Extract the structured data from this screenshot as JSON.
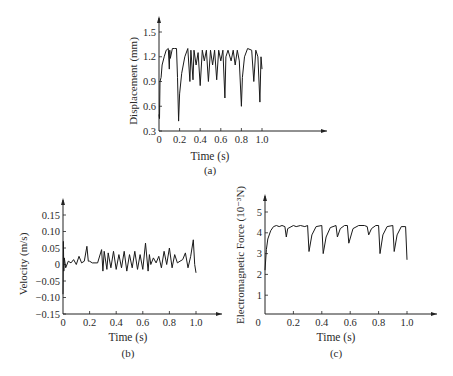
{
  "chart_data": [
    {
      "panel": "(a)",
      "type": "line",
      "xlabel": "Time (s)",
      "ylabel": "Displacement (mm)",
      "xticks": [
        "0",
        "0.2",
        "0.4",
        "0.6",
        "0.8",
        "1.0"
      ],
      "yticks": [
        "0.3",
        "0.6",
        "0.9",
        "1.2",
        "1.5"
      ],
      "xlim": [
        0,
        1.0
      ],
      "ylim": [
        0.3,
        1.65
      ],
      "grid": false,
      "x": [
        0,
        0.005,
        0.01,
        0.02,
        0.03,
        0.05,
        0.07,
        0.09,
        0.1,
        0.105,
        0.11,
        0.13,
        0.15,
        0.17,
        0.18,
        0.19,
        0.2,
        0.22,
        0.25,
        0.28,
        0.3,
        0.31,
        0.33,
        0.34,
        0.36,
        0.38,
        0.4,
        0.42,
        0.44,
        0.46,
        0.48,
        0.5,
        0.52,
        0.54,
        0.56,
        0.58,
        0.6,
        0.62,
        0.64,
        0.65,
        0.67,
        0.7,
        0.72,
        0.74,
        0.76,
        0.78,
        0.8,
        0.81,
        0.83,
        0.86,
        0.9,
        0.92,
        0.94,
        0.96,
        0.98,
        0.99,
        1.0
      ],
      "values": [
        0.5,
        0.45,
        0.9,
        0.95,
        1.1,
        1.2,
        1.28,
        1.3,
        1.05,
        1.28,
        1.18,
        1.3,
        1.3,
        1.3,
        0.95,
        0.42,
        0.75,
        1.0,
        1.2,
        1.3,
        0.9,
        1.28,
        0.92,
        1.28,
        1.1,
        1.25,
        0.85,
        1.28,
        1.15,
        1.28,
        0.9,
        1.28,
        1.1,
        1.28,
        0.92,
        1.28,
        1.15,
        1.28,
        0.7,
        1.2,
        1.28,
        1.15,
        1.28,
        1.1,
        1.28,
        1.15,
        0.6,
        0.95,
        1.2,
        1.3,
        1.28,
        0.9,
        1.28,
        1.2,
        0.65,
        1.2,
        1.05
      ],
      "caption": "(a)"
    },
    {
      "panel": "(b)",
      "type": "line",
      "xlabel": "Time (s)",
      "ylabel": "Velocity (m/s)",
      "xticks": [
        "0",
        "0.2",
        "0.4",
        "0.6",
        "0.8",
        "1.0"
      ],
      "yticks": [
        "-0.15",
        "-0.10",
        "-0.05",
        "0",
        "0.05",
        "0.10",
        "0.15"
      ],
      "xlim": [
        0,
        1.0
      ],
      "ylim": [
        -0.15,
        0.18
      ],
      "grid": false,
      "x": [
        0,
        0.003,
        0.006,
        0.01,
        0.02,
        0.04,
        0.06,
        0.08,
        0.1,
        0.12,
        0.14,
        0.16,
        0.18,
        0.19,
        0.2,
        0.22,
        0.26,
        0.29,
        0.3,
        0.31,
        0.33,
        0.34,
        0.36,
        0.38,
        0.4,
        0.42,
        0.44,
        0.46,
        0.48,
        0.5,
        0.52,
        0.54,
        0.56,
        0.58,
        0.6,
        0.62,
        0.64,
        0.65,
        0.66,
        0.68,
        0.7,
        0.72,
        0.74,
        0.76,
        0.78,
        0.8,
        0.82,
        0.84,
        0.86,
        0.88,
        0.9,
        0.92,
        0.94,
        0.96,
        0.98,
        0.99,
        1.0
      ],
      "values": [
        -0.09,
        0.07,
        -0.02,
        0.02,
        -0.01,
        0.01,
        0.005,
        0.015,
        0.0,
        0.025,
        0.005,
        0.01,
        0.055,
        0.01,
        0.01,
        0.005,
        0.005,
        0.045,
        -0.02,
        0.04,
        -0.015,
        0.035,
        -0.01,
        0.04,
        -0.015,
        0.03,
        -0.01,
        0.04,
        -0.02,
        0.03,
        -0.01,
        0.04,
        -0.015,
        0.03,
        -0.015,
        0.065,
        -0.02,
        0.03,
        0.0,
        0.02,
        0.005,
        0.025,
        -0.01,
        0.04,
        0.0,
        0.05,
        -0.01,
        0.03,
        0.005,
        0.01,
        0.015,
        0.035,
        -0.01,
        0.025,
        0.075,
        0.0,
        -0.025
      ],
      "caption": "(b)"
    },
    {
      "panel": "(c)",
      "type": "line",
      "xlabel": "Time (s)",
      "ylabel": "Electromagnetic Force (10⁻³N)",
      "xticks": [
        "0",
        "0.2",
        "0.4",
        "0.6",
        "0.8",
        "1.0"
      ],
      "yticks": [
        "0",
        "1",
        "2",
        "3",
        "4",
        "5"
      ],
      "xlim": [
        0,
        1.0
      ],
      "ylim": [
        0,
        5.6
      ],
      "grid": false,
      "x": [
        0,
        0.01,
        0.02,
        0.04,
        0.06,
        0.08,
        0.1,
        0.12,
        0.14,
        0.15,
        0.16,
        0.2,
        0.22,
        0.25,
        0.28,
        0.3,
        0.31,
        0.33,
        0.36,
        0.4,
        0.41,
        0.43,
        0.46,
        0.5,
        0.51,
        0.53,
        0.56,
        0.58,
        0.59,
        0.62,
        0.66,
        0.7,
        0.72,
        0.73,
        0.75,
        0.78,
        0.8,
        0.81,
        0.83,
        0.86,
        0.9,
        0.91,
        0.93,
        0.96,
        0.99,
        1.0
      ],
      "values": [
        2.2,
        3.2,
        3.7,
        4.1,
        4.3,
        4.35,
        4.3,
        4.35,
        4.3,
        3.8,
        4.2,
        4.35,
        4.3,
        4.35,
        4.3,
        4.35,
        3.1,
        3.9,
        4.3,
        4.35,
        3.0,
        3.8,
        4.25,
        4.35,
        3.8,
        4.2,
        4.35,
        4.35,
        3.5,
        4.2,
        4.35,
        4.35,
        4.3,
        3.9,
        4.2,
        4.35,
        4.35,
        3.0,
        3.9,
        4.3,
        4.35,
        3.1,
        3.9,
        4.3,
        4.3,
        2.7
      ],
      "caption": "(c)"
    }
  ]
}
